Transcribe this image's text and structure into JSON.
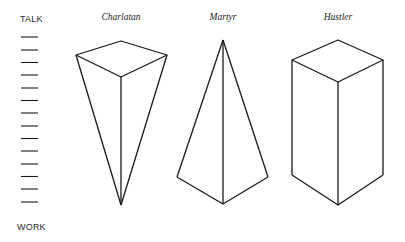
{
  "scale": {
    "top_label": "TALK",
    "bottom_label": "WORK",
    "tick_count": 14
  },
  "shapes": [
    {
      "title": "Charlatan",
      "form": "inverted-pyramid",
      "description": "Wide diamond top tapering to a single point at the bottom (mostly talk, little work)"
    },
    {
      "title": "Martyr",
      "form": "pyramid",
      "description": "Single point at the top widening to a broad base at the bottom (little talk, mostly work)"
    },
    {
      "title": "Hustler",
      "form": "rectangular-prism",
      "description": "Uniform column from top to bottom (equal talk and work)"
    }
  ],
  "colors": {
    "stroke": "#1a1a1a",
    "background": "#ffffff"
  }
}
